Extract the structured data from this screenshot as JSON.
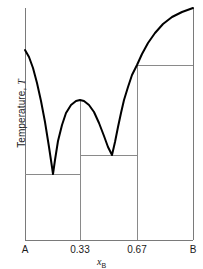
{
  "chart_data": {
    "type": "line",
    "title": "",
    "subtitle": "",
    "xlabel": "x_B",
    "xlabel_base": "x",
    "xlabel_sub": "B",
    "ylabel": "Temperature, T",
    "ylabel_base": "Temperature, ",
    "ylabel_italic": "T",
    "grid": false,
    "legend": "none",
    "x_tick_labels": [
      "A",
      "0.33",
      "0.67",
      "B"
    ],
    "x_tick_values": [
      0,
      0.33,
      0.67,
      1
    ],
    "y_tick_labels": [],
    "xlim": [
      0,
      1
    ],
    "ylim": [
      0,
      1
    ],
    "axis_box": {
      "left_px": 25,
      "right_px": 193,
      "top_px": 8,
      "bottom_px": 240
    },
    "series": [
      {
        "name": "liquidus",
        "role": "liquidus-curve",
        "stroke": "#000000",
        "width_px": 2,
        "points_px": [
          [
            25,
            50
          ],
          [
            29,
            57
          ],
          [
            33,
            68
          ],
          [
            37,
            83
          ],
          [
            41,
            101
          ],
          [
            45,
            122
          ],
          [
            49,
            147
          ],
          [
            52,
            167
          ],
          [
            53,
            174
          ],
          [
            55,
            160
          ],
          [
            58,
            141
          ],
          [
            62,
            125
          ],
          [
            66,
            113
          ],
          [
            71,
            105
          ],
          [
            76,
            101
          ],
          [
            80,
            100
          ],
          [
            84,
            101
          ],
          [
            89,
            105
          ],
          [
            94,
            112
          ],
          [
            99,
            123
          ],
          [
            104,
            136
          ],
          [
            108,
            147
          ],
          [
            112,
            155
          ],
          [
            115,
            142
          ],
          [
            118,
            127
          ],
          [
            121,
            113
          ],
          [
            124,
            100
          ],
          [
            128,
            87
          ],
          [
            132,
            75
          ],
          [
            137,
            65
          ],
          [
            142,
            54
          ],
          [
            148,
            43
          ],
          [
            155,
            33
          ],
          [
            163,
            24
          ],
          [
            172,
            17
          ],
          [
            182,
            12
          ],
          [
            193,
            8
          ]
        ]
      }
    ],
    "tie_lines": [
      {
        "name": "eutectic-tie-line-1",
        "y_px": 174,
        "x_start_px": 25,
        "x_end_px": 80
      },
      {
        "name": "eutectic-tie-line-2",
        "y_px": 155,
        "x_start_px": 80,
        "x_end_px": 137
      },
      {
        "name": "eutectic-tie-line-3",
        "y_px": 65,
        "x_start_px": 137,
        "x_end_px": 193
      }
    ],
    "vertical_lines": [
      {
        "name": "compound-line-0.33",
        "x_px": 80,
        "y_top_px": 100,
        "y_bottom_px": 240
      },
      {
        "name": "compound-line-0.67",
        "x_px": 137,
        "y_top_px": 65,
        "y_bottom_px": 240
      }
    ],
    "eutectic_points_px": [
      [
        53,
        174
      ],
      [
        112,
        155
      ]
    ],
    "congruent_max_px": [
      80,
      100
    ],
    "axis_color": "#7a7a7a",
    "curve_color": "#000000",
    "line_color": "#8a8a8a",
    "background": "#ffffff"
  },
  "ticks": [
    {
      "label": "A",
      "x_px": 25
    },
    {
      "label": "0.33",
      "x_px": 80
    },
    {
      "label": "0.67",
      "x_px": 137
    },
    {
      "label": "B",
      "x_px": 193
    }
  ]
}
